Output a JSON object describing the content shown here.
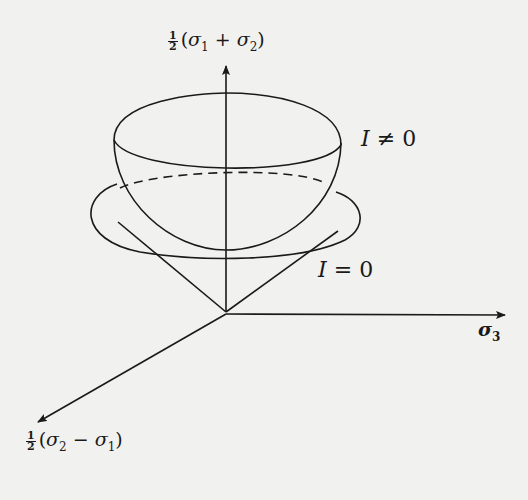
{
  "diagram": {
    "type": "3d-coordinate-surface-sketch",
    "axes": {
      "vertical": {
        "fraction_num": "1",
        "fraction_den": "2",
        "expr_open": "(",
        "s_a": "σ",
        "s_a_sub": "1",
        "op": "+",
        "s_b": "σ",
        "s_b_sub": "2",
        "expr_close": ")"
      },
      "horizontal": {
        "symbol": "σ",
        "sub": "3"
      },
      "diagonal": {
        "fraction_num": "1",
        "fraction_den": "2",
        "expr_open": "(",
        "s_a": "σ",
        "s_a_sub": "2",
        "op": "−",
        "s_b": "σ",
        "s_b_sub": "1",
        "expr_close": ")"
      }
    },
    "surfaces": {
      "hemisphere": {
        "var": "I",
        "rel": "≠",
        "val": "0"
      },
      "cone": {
        "var": "I",
        "rel": "=",
        "val": "0"
      }
    },
    "colors": {
      "ink": "#1a1a1a",
      "paper": "#f1f1ef"
    }
  }
}
